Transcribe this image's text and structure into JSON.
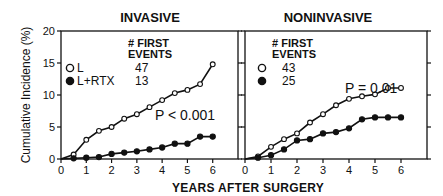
{
  "figure": {
    "ylabel": "Cumulative Incidence (%)",
    "xlabel": "YEARS AFTER SURGERY"
  },
  "panels": [
    {
      "title": "INVASIVE",
      "legend_header": [
        "# FIRST",
        "EVENTS"
      ],
      "legend": [
        {
          "marker": "open-circle",
          "label": "L",
          "count": "47"
        },
        {
          "marker": "filled-circle",
          "label": "L+RTX",
          "count": "13"
        }
      ],
      "pvalue": "P < 0.001"
    },
    {
      "title": "NONINVASIVE",
      "legend_header": [
        "# FIRST",
        "EVENTS"
      ],
      "legend": [
        {
          "marker": "open-circle",
          "label": "",
          "count": "43"
        },
        {
          "marker": "filled-circle",
          "label": "",
          "count": "25"
        }
      ],
      "pvalue": "P = 0.01"
    }
  ],
  "chart_data": [
    {
      "type": "line",
      "title": "INVASIVE",
      "xlabel": "YEARS AFTER SURGERY",
      "ylabel": "Cumulative Incidence (%)",
      "xlim": [
        0,
        7
      ],
      "ylim": [
        0,
        20
      ],
      "xticks": [
        0,
        1,
        2,
        3,
        4,
        5,
        6
      ],
      "yticks": [
        0,
        5,
        10,
        15,
        20
      ],
      "grid": false,
      "x": [
        0,
        0.5,
        1,
        1.5,
        2,
        2.5,
        3,
        3.5,
        4,
        4.5,
        5,
        5.5,
        6
      ],
      "series": [
        {
          "name": "L",
          "marker": "open-circle",
          "first_events": 47,
          "values": [
            0,
            0.7,
            3.0,
            4.4,
            5.0,
            6.3,
            7.0,
            8.1,
            9.2,
            10.3,
            10.8,
            11.7,
            14.8
          ]
        },
        {
          "name": "L+RTX",
          "marker": "filled-circle",
          "first_events": 13,
          "values": [
            0,
            0.1,
            0.2,
            0.3,
            0.8,
            1.0,
            1.2,
            1.5,
            1.8,
            2.4,
            2.4,
            3.5,
            3.5
          ]
        }
      ],
      "annotations": [
        "# FIRST EVENTS",
        "P < 0.001"
      ],
      "legend_position": "upper left"
    },
    {
      "type": "line",
      "title": "NONINVASIVE",
      "xlabel": "YEARS AFTER SURGERY",
      "ylabel": "Cumulative Incidence (%)",
      "xlim": [
        0,
        7
      ],
      "ylim": [
        0,
        20
      ],
      "xticks": [
        0,
        1,
        2,
        3,
        4,
        5,
        6
      ],
      "yticks": [
        0,
        5,
        10,
        15,
        20
      ],
      "grid": false,
      "x": [
        0,
        0.5,
        1,
        1.5,
        2,
        2.5,
        3,
        3.5,
        4,
        4.5,
        5,
        5.5,
        6
      ],
      "series": [
        {
          "name": "L",
          "marker": "open-circle",
          "first_events": 43,
          "values": [
            0,
            0.4,
            1.9,
            3.1,
            4.0,
            5.7,
            7.0,
            8.4,
            9.4,
            9.8,
            10.1,
            11.1,
            11.1
          ]
        },
        {
          "name": "L+RTX",
          "marker": "filled-circle",
          "first_events": 25,
          "values": [
            0,
            0.2,
            0.6,
            1.5,
            2.9,
            3.1,
            4.0,
            4.2,
            4.8,
            6.2,
            6.5,
            6.5,
            6.5
          ]
        }
      ],
      "annotations": [
        "# FIRST EVENTS",
        "P = 0.01"
      ],
      "legend_position": "upper left"
    }
  ]
}
